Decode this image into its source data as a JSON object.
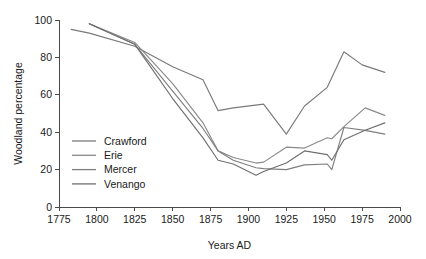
{
  "chart_data": {
    "type": "line",
    "title": "",
    "xlabel": "Years AD",
    "ylabel": "Woodland percentage",
    "xlim": [
      1775,
      2000
    ],
    "ylim": [
      0,
      100
    ],
    "xticks": [
      1775,
      1800,
      1825,
      1850,
      1875,
      1900,
      1925,
      1950,
      1975,
      2000
    ],
    "yticks": [
      0,
      20,
      40,
      60,
      80,
      100
    ],
    "xtick_labels": [
      "1775",
      "1800",
      "1825",
      "1850",
      "1875",
      "1900",
      "1925",
      "1950",
      "1975",
      "2000"
    ],
    "ytick_labels": [
      "0",
      "20",
      "40",
      "60",
      "80",
      "100"
    ],
    "grid": false,
    "legend_position": "center-left",
    "series": [
      {
        "name": "Crawford",
        "color": "#7a7a7a",
        "x": [
          1783,
          1795,
          1825,
          1850,
          1870,
          1880,
          1890,
          1910,
          1925,
          1937,
          1952,
          1963,
          1975,
          1990
        ],
        "y": [
          95,
          93,
          86,
          75,
          68,
          51.5,
          53,
          55,
          39,
          54,
          64,
          83,
          76,
          72
        ]
      },
      {
        "name": "Erie",
        "color": "#8a8a8a",
        "x": [
          1795,
          1825,
          1850,
          1870,
          1880,
          1890,
          1905,
          1910,
          1925,
          1937,
          1952,
          1955,
          1963,
          1977,
          1990
        ],
        "y": [
          98,
          88,
          66,
          45,
          30,
          26.5,
          23.5,
          24,
          32,
          31.5,
          37,
          36.5,
          43,
          53,
          49
        ]
      },
      {
        "name": "Mercer",
        "color": "#7f7f7f",
        "x": [
          1795,
          1825,
          1850,
          1870,
          1880,
          1890,
          1905,
          1910,
          1925,
          1937,
          1952,
          1955,
          1963,
          1977,
          1990
        ],
        "y": [
          98,
          87,
          62,
          42,
          30,
          25,
          21,
          20.5,
          20,
          22.5,
          23,
          20,
          42.5,
          41,
          39
        ]
      },
      {
        "name": "Venango",
        "color": "#6f6f6f",
        "x": [
          1795,
          1825,
          1850,
          1870,
          1880,
          1890,
          1905,
          1910,
          1925,
          1937,
          1952,
          1955,
          1963,
          1977,
          1990
        ],
        "y": [
          98,
          87,
          58,
          37,
          25,
          23,
          17,
          19,
          23.5,
          30,
          28,
          25,
          36,
          41,
          45
        ]
      }
    ]
  }
}
